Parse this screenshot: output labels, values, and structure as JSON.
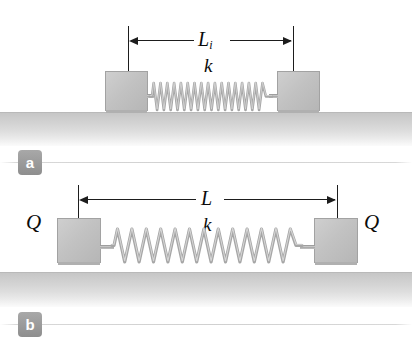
{
  "figure": {
    "type": "physics-diagram",
    "background_color": "#ffffff"
  },
  "panels": [
    {
      "id": "a",
      "badge_label": "a",
      "dimension": {
        "symbol": "L",
        "subscript": "i",
        "meaning": "initial spring length",
        "span_px": [
          128,
          293
        ],
        "y_px": 40
      },
      "spring": {
        "symbol": "k",
        "state": "relaxed-compressed",
        "coils": 18,
        "span_px": [
          150,
          272
        ],
        "centerline_y_px": 96
      },
      "blocks": [
        {
          "name": "left-block",
          "x_px": 105,
          "y_px": 71,
          "w_px": 43,
          "h_px": 40,
          "charge_label": ""
        },
        {
          "name": "right-block",
          "x_px": 277,
          "y_px": 71,
          "w_px": 43,
          "h_px": 40,
          "charge_label": ""
        }
      ],
      "ground": {
        "top_px": 112,
        "height_px": 33,
        "color": "#c9c9c9"
      }
    },
    {
      "id": "b",
      "badge_label": "b",
      "dimension": {
        "symbol": "L",
        "subscript": "",
        "meaning": "stretched spring length",
        "span_px": [
          78,
          337
        ],
        "y_px": 21
      },
      "spring": {
        "symbol": "k",
        "state": "stretched",
        "coils": 13,
        "span_px": [
          112,
          302
        ],
        "centerline_y_px": 69
      },
      "blocks": [
        {
          "name": "left-block",
          "x_px": 57,
          "y_px": 40,
          "w_px": 44,
          "h_px": 45,
          "charge_label": "Q"
        },
        {
          "name": "right-block",
          "x_px": 314,
          "y_px": 40,
          "w_px": 44,
          "h_px": 45,
          "charge_label": "Q"
        }
      ],
      "charges": [
        {
          "name": "left-charge",
          "label": "Q",
          "x_px": 26,
          "y_px": 34
        },
        {
          "name": "right-charge",
          "label": "Q",
          "x_px": 364,
          "y_px": 34
        }
      ],
      "ground": {
        "top_px": 94,
        "height_px": 34,
        "color": "#c9c9c9"
      }
    }
  ],
  "colors": {
    "block_fill": "#c2c2c2",
    "block_stroke": "#a2a2a2",
    "spring_stroke": "#a8a8a8",
    "ground_top": "#c6c6c6",
    "dimension_line": "#1d1d1d",
    "badge_fill": "#9a9a9a",
    "badge_text": "#ffffff"
  }
}
